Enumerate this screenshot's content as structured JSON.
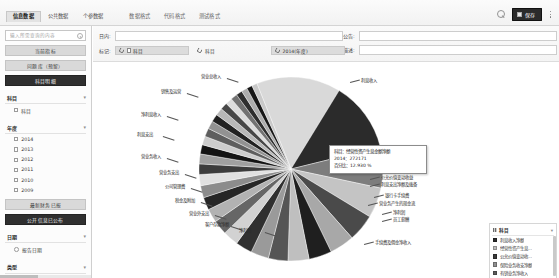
{
  "window": {
    "tabs_left": [
      {
        "label": "信息数据",
        "active": true
      },
      {
        "label": "公共数据",
        "active": false
      },
      {
        "label": "个参数据",
        "active": false
      }
    ],
    "tabs_right": [
      {
        "label": "数据格式",
        "active": false
      },
      {
        "label": "代码格式",
        "active": false
      },
      {
        "label": "测试格式",
        "active": false
      }
    ],
    "search_icon": "search-icon",
    "save_label": "保存",
    "save_icon": "save-icon",
    "more_icon": "more-dots-icon"
  },
  "sidebar": {
    "search_placeholder": "输入所需查询的内容",
    "search_icon": "search-icon",
    "buttons": [
      {
        "label": "当前指标",
        "style": "gray"
      },
      {
        "label": "问题库（预留）",
        "style": "gray"
      },
      {
        "label": "科目明细",
        "style": "dark"
      }
    ],
    "sections": [
      {
        "title": "科目",
        "collapse_icon": "chevron-collapse-icon",
        "items": [
          {
            "label": "科目",
            "icon": "checkbox-icon"
          }
        ]
      },
      {
        "title": "年度",
        "collapse_icon": "chevron-collapse-icon",
        "items": [
          {
            "label": "2014",
            "icon": "checkbox-icon"
          },
          {
            "label": "2013",
            "icon": "checkbox-icon"
          },
          {
            "label": "2012",
            "icon": "checkbox-icon"
          },
          {
            "label": "2011",
            "icon": "checkbox-icon"
          },
          {
            "label": "2010",
            "icon": "checkbox-icon"
          },
          {
            "label": "2009",
            "icon": "checkbox-icon"
          }
        ]
      }
    ],
    "buttons2": [
      {
        "label": "最新财务已报",
        "style": "gray"
      },
      {
        "label": "公开信息已公布",
        "style": "dark"
      }
    ],
    "sections2": [
      {
        "title": "日期",
        "collapse_icon": "chevron-collapse-icon",
        "items": [
          {
            "label": "报告日期",
            "icon": "calendar-icon"
          }
        ]
      },
      {
        "title": "类型",
        "collapse_icon": "chevron-collapse-icon",
        "items": [
          {
            "label": "报表内科目分类",
            "icon": "checkbox-icon"
          }
        ]
      }
    ]
  },
  "filters": {
    "row1": {
      "label": "日内:",
      "value": "",
      "placeholder": ""
    },
    "row1b": {
      "label": "公告:",
      "value": "",
      "placeholder": ""
    },
    "row2": {
      "label": "描述:",
      "value": "",
      "placeholder": ""
    },
    "row3_label": "标记:",
    "chips": [
      {
        "label": "科目",
        "icon": "refresh-icon",
        "has_box": true,
        "filled": false
      },
      {
        "label": "科目",
        "icon": "refresh-icon",
        "has_box": false,
        "filled": false
      },
      {
        "label": "2014(年度)",
        "icon": "refresh-icon",
        "has_box": false,
        "filled": true
      }
    ]
  },
  "chart_data": {
    "type": "pie",
    "title": "",
    "legend_position": "right",
    "legend_title": "科目",
    "tooltip": {
      "line1": "科目：经营性资产生息金额净额",
      "line2": "2014：272171",
      "line3": "百分比：12.930 %"
    },
    "slices": [
      {
        "label": "营业总收入",
        "value": 272171,
        "percent": 12.93,
        "color": "#d9d9d9"
      },
      {
        "label": "利息收入",
        "value": 228000,
        "percent": 10.83,
        "color": "#2b2b2b"
      },
      {
        "label": "手续费及佣金收入",
        "value": 132000,
        "percent": 6.27,
        "color": "#7d7d7d"
      },
      {
        "label": "公允价值变动收益",
        "value": 98000,
        "percent": 4.66,
        "color": "#c4c4c4"
      },
      {
        "label": "保险业务收支净额",
        "value": 88000,
        "percent": 4.18,
        "color": "#4a4a4a"
      },
      {
        "label": "已赚保费收入",
        "value": 80000,
        "percent": 3.8,
        "color": "#a8a8a8"
      },
      {
        "label": "营业总成本",
        "value": 74000,
        "percent": 3.52,
        "color": "#1f1f1f"
      },
      {
        "label": "银行利息支出",
        "value": 68000,
        "percent": 3.23,
        "color": "#bfbfbf"
      },
      {
        "label": "经营活动现金流入",
        "value": 63000,
        "percent": 2.99,
        "color": "#555555"
      },
      {
        "label": "资产减值损失",
        "value": 58000,
        "percent": 2.76,
        "color": "#9a9a9a"
      },
      {
        "label": "投资收益净额",
        "value": 54000,
        "percent": 2.57,
        "color": "#303030"
      },
      {
        "label": "汇兑净收益",
        "value": 50000,
        "percent": 2.38,
        "color": "#d2d2d2"
      },
      {
        "label": "其他业务收入",
        "value": 47000,
        "percent": 2.23,
        "color": "#666666"
      },
      {
        "label": "营业利润",
        "value": 44000,
        "percent": 2.09,
        "color": "#b2b2b2"
      },
      {
        "label": "营业外收入",
        "value": 41000,
        "percent": 1.95,
        "color": "#262626"
      },
      {
        "label": "利润总额",
        "value": 39000,
        "percent": 1.85,
        "color": "#8c8c8c"
      },
      {
        "label": "所得税费用",
        "value": 36000,
        "percent": 1.71,
        "color": "#e0e0e0"
      },
      {
        "label": "净利润",
        "value": 34000,
        "percent": 1.62,
        "color": "#3c3c3c"
      },
      {
        "label": "归属母公司净利润",
        "value": 32000,
        "percent": 1.52,
        "color": "#a0a0a0"
      },
      {
        "label": "少数股东损益",
        "value": 30000,
        "percent": 1.43,
        "color": "#141414"
      },
      {
        "label": "基本每股收益",
        "value": 28000,
        "percent": 1.33,
        "color": "#cccccc"
      },
      {
        "label": "稀释每股收益",
        "value": 27000,
        "percent": 1.28,
        "color": "#5e5e5e"
      },
      {
        "label": "经营活动现金流出",
        "value": 26000,
        "percent": 1.24,
        "color": "#929292"
      },
      {
        "label": "投资活动现金流入",
        "value": 25000,
        "percent": 1.19,
        "color": "#222222"
      },
      {
        "label": "投资活动现金流出",
        "value": 24000,
        "percent": 1.14,
        "color": "#b8b8b8"
      },
      {
        "label": "筹资活动现金流入",
        "value": 23000,
        "percent": 1.09,
        "color": "#484848"
      },
      {
        "label": "筹资活动现金流出",
        "value": 22000,
        "percent": 1.05,
        "color": "#dcdcdc"
      },
      {
        "label": "现金及等价物净增加额",
        "value": 21000,
        "percent": 1.0,
        "color": "#727272"
      },
      {
        "label": "期末现金及等价物余额",
        "value": 20000,
        "percent": 0.95,
        "color": "#2e2e2e"
      },
      {
        "label": "资产总计",
        "value": 19000,
        "percent": 0.9,
        "color": "#adadad"
      },
      {
        "label": "负债合计",
        "value": 18000,
        "percent": 0.86,
        "color": "#171717"
      },
      {
        "label": "所有者权益合计",
        "value": 17000,
        "percent": 0.81,
        "color": "#c9c9c9"
      }
    ],
    "callout_labels_left": [
      {
        "label": "营业总收入",
        "x": 108,
        "y": 12
      },
      {
        "label": "销售及运营",
        "x": 68,
        "y": 27
      },
      {
        "label": "净利息收入",
        "x": 48,
        "y": 50
      },
      {
        "label": "利息支出",
        "x": 44,
        "y": 70
      },
      {
        "label": "营业务收入",
        "x": 48,
        "y": 92
      },
      {
        "label": "营业务支出",
        "x": 66,
        "y": 108
      },
      {
        "label": "公司管理费",
        "x": 72,
        "y": 122
      },
      {
        "label": "税金及附加",
        "x": 82,
        "y": 136
      },
      {
        "label": "营业外支出",
        "x": 96,
        "y": 149
      },
      {
        "label": "客户存款净额",
        "x": 112,
        "y": 160
      },
      {
        "label": "净利润",
        "x": 146,
        "y": 166
      }
    ],
    "callout_labels_right": [
      {
        "label": "利息收入",
        "x": 268,
        "y": 16
      },
      {
        "label": "汇兑净收益",
        "x": 296,
        "y": 96
      },
      {
        "label": "其他业务收支",
        "x": 296,
        "y": 103
      },
      {
        "label": "公允价值变动收益",
        "x": 288,
        "y": 113
      },
      {
        "label": "利息支出净额及拨备",
        "x": 288,
        "y": 120
      },
      {
        "label": "银行卡手续费",
        "x": 292,
        "y": 131
      },
      {
        "label": "营业务产生的现金流",
        "x": 286,
        "y": 139
      },
      {
        "label": "净利润",
        "x": 300,
        "y": 148
      },
      {
        "label": "员工薪酬",
        "x": 300,
        "y": 155
      },
      {
        "label": "手续费及佣金净收入",
        "x": 282,
        "y": 178
      }
    ],
    "legend_entries": [
      {
        "label": "科目",
        "color": "#777777",
        "header": true
      },
      {
        "label": "利息收入净额",
        "color": "#2b2b2b"
      },
      {
        "label": "经营性资产生息...",
        "color": "#bdbdbd"
      },
      {
        "label": "公允价值变动收...",
        "color": "#3a3a3a"
      },
      {
        "label": "保险业务收支净额",
        "color": "#8f8f8f"
      },
      {
        "label": "有销业务净收入",
        "color": "#5c5c5c"
      },
      {
        "label": "营业外收支净...",
        "color": "#d0d0d0"
      }
    ]
  }
}
